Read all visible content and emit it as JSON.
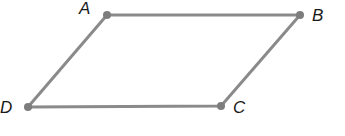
{
  "diagram": {
    "type": "parallelogram",
    "line_color": "#8a8a8a",
    "point_color": "#7d7d7d",
    "vertices": [
      {
        "label": "A",
        "x": 107,
        "y": 15,
        "lx": 79,
        "ly": 14
      },
      {
        "label": "B",
        "x": 300,
        "y": 15,
        "lx": 312,
        "ly": 21
      },
      {
        "label": "C",
        "x": 221,
        "y": 106,
        "lx": 233,
        "ly": 113
      },
      {
        "label": "D",
        "x": 28,
        "y": 107,
        "lx": 0,
        "ly": 113
      }
    ]
  }
}
